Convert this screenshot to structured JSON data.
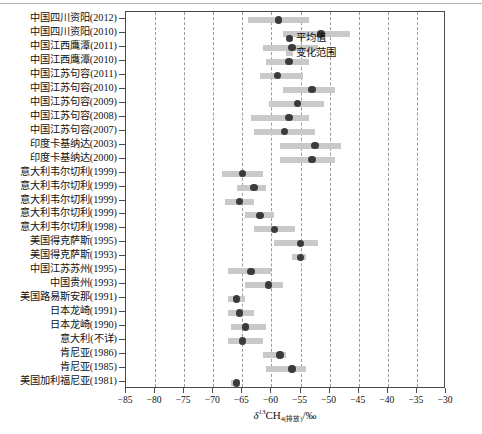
{
  "legend": {
    "items": [
      {
        "label": "平均值",
        "marker": "mean-dot-icon",
        "color": "#3b3b3b"
      },
      {
        "label": "变化范围",
        "marker": "range-bar-icon",
        "color": "#c9c9c9"
      }
    ]
  },
  "axis": {
    "x_title_delta": "δ",
    "x_title_sup": "13",
    "x_title_main": "CH",
    "x_title_sub": "4(排放)",
    "x_title_unit": "/‰",
    "x_title_full": "δ13CH4(排放)/‰",
    "x_ticks": [
      "−85",
      "−80",
      "−75",
      "−70",
      "−65",
      "−60",
      "−55",
      "−50",
      "−45",
      "−40",
      "−35",
      "−30"
    ],
    "x_tick_values": [
      -85,
      -80,
      -75,
      -70,
      -65,
      -60,
      -55,
      -50,
      -45,
      -40,
      -35,
      -30
    ],
    "grid": true
  },
  "colors": {
    "range_bar": "#c9c9c9",
    "mean_dot": "#3b3b3b",
    "frame": "#4a4a4a",
    "gridline": "#9a9a9a",
    "background": "#ffffff"
  },
  "chart_data": {
    "type": "bar",
    "subtype": "range-with-mean (floating bar / dot-whisker)",
    "title": "",
    "xlabel": "δ13CH4(排放)/‰",
    "ylabel": "",
    "xlim": [
      -85,
      -30
    ],
    "grid": true,
    "legend": [
      "平均值",
      "变化范围"
    ],
    "legend_position": "top-left-inside",
    "orientation": "horizontal",
    "categories": [
      "中国四川资阳(2012)",
      "中国四川资阳(2010)",
      "中国江西鹰潭(2011)",
      "中国江西鹰潭(2010)",
      "中国江苏句容(2011)",
      "中国江苏句容(2010)",
      "中国江苏句容(2009)",
      "中国江苏句容(2008)",
      "中国江苏句容(2007)",
      "印度卡基纳达(2003)",
      "印度卡基纳达(2000)",
      "意大利韦尔切利(1999)",
      "意大利韦尔切利(1999)",
      "意大利韦尔切利(1999)",
      "意大利韦尔切利(1999)",
      "意大利韦尔切利(1998)",
      "美国得克萨斯(1995)",
      "美国得克萨斯(1993)",
      "中国江苏苏州(1995)",
      "中国贵州(1993)",
      "美国路易斯安那(1991)",
      "日本龙崎(1991)",
      "日本龙崎(1990)",
      "意大利(不详)",
      "肯尼亚(1986)",
      "肯尼亚(1985)",
      "美国加利福尼亚(1981)"
    ],
    "series": [
      {
        "name": "变化范围",
        "type": "range",
        "values": [
          [
            -64.0,
            -53.5
          ],
          [
            -58.0,
            -46.5
          ],
          [
            -61.5,
            -52.0
          ],
          [
            -61.0,
            -53.5
          ],
          [
            -62.0,
            -54.5
          ],
          [
            -58.0,
            -49.0
          ],
          [
            -60.5,
            -51.0
          ],
          [
            -63.5,
            -53.5
          ],
          [
            -63.0,
            -52.5
          ],
          [
            -58.5,
            -48.0
          ],
          [
            -58.5,
            -49.0
          ],
          [
            -68.5,
            -61.5
          ],
          [
            -66.0,
            -61.0
          ],
          [
            -68.0,
            -63.0
          ],
          [
            -64.5,
            -59.5
          ],
          [
            -63.0,
            -56.0
          ],
          [
            -59.5,
            -52.0
          ],
          [
            -56.5,
            -54.0
          ],
          [
            -67.5,
            -60.0
          ],
          [
            -64.5,
            -58.0
          ],
          [
            -67.5,
            -64.5
          ],
          [
            -67.5,
            -63.0
          ],
          [
            -67.0,
            -61.0
          ],
          [
            -67.5,
            -61.5
          ],
          [
            -61.5,
            -57.5
          ],
          [
            -61.0,
            -54.0
          ],
          [
            -67.0,
            -65.5
          ]
        ]
      },
      {
        "name": "平均值",
        "type": "point",
        "values": [
          -58.8,
          -51.5,
          -56.5,
          -57.0,
          -59.0,
          -53.0,
          -55.5,
          -57.0,
          -57.8,
          -52.5,
          -53.0,
          -65.0,
          -63.0,
          -65.5,
          -62.0,
          -59.5,
          -55.0,
          -55.0,
          -63.5,
          -60.5,
          -66.0,
          -65.5,
          -64.5,
          -65.0,
          -58.5,
          -56.5,
          -66.0
        ]
      }
    ]
  }
}
